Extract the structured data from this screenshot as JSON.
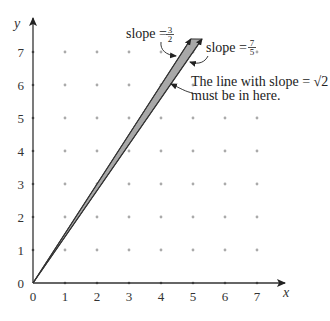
{
  "diagram": {
    "axes": {
      "x_label": "x",
      "y_label": "y",
      "x_ticks": [
        "0",
        "1",
        "2",
        "3",
        "4",
        "5",
        "6",
        "7"
      ],
      "y_ticks": [
        "0",
        "1",
        "2",
        "3",
        "4",
        "5",
        "6",
        "7"
      ],
      "x_range": [
        0,
        7
      ],
      "y_range": [
        0,
        7
      ]
    },
    "grid": {
      "style": "dots",
      "x_from": 1,
      "x_to": 7,
      "y_from": 1,
      "y_to": 7
    },
    "lines": [
      {
        "name": "slope-3-2",
        "slope": 1.5,
        "x_end": 4.93
      },
      {
        "name": "slope-7-5",
        "slope": 1.4,
        "x_end": 5.28
      }
    ],
    "wedge_fill": "#a8a8a8",
    "annotations": {
      "slope_a": {
        "prefix": "slope = ",
        "num": "3",
        "den": "2"
      },
      "slope_b": {
        "prefix": "slope = ",
        "num": "7",
        "den": "5"
      },
      "note_line1": "The line with slope = √2",
      "note_line2": "must be in here."
    }
  }
}
